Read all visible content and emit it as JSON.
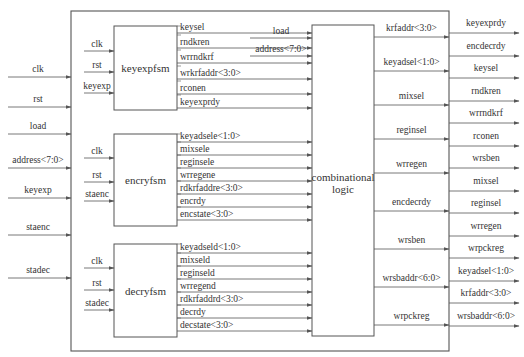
{
  "diagram": {
    "outer_box": {
      "x": 71,
      "y": 11,
      "w": 378,
      "h": 340
    },
    "colors": {
      "line": "#555555",
      "text": "#333333",
      "background": "#ffffff"
    },
    "external_inputs": [
      {
        "label": "clk",
        "y": 77
      },
      {
        "label": "rst",
        "y": 107
      },
      {
        "label": "load",
        "y": 134
      },
      {
        "label": "address<7:0>",
        "y": 168
      },
      {
        "label": "keyexp",
        "y": 198
      },
      {
        "label": "staenc",
        "y": 235
      },
      {
        "label": "stadec",
        "y": 278
      }
    ],
    "blocks": [
      {
        "name": "keyexpfsm",
        "x": 114,
        "y": 26,
        "w": 63,
        "h": 84,
        "inputs": [
          {
            "label": "clk",
            "y": 51
          },
          {
            "label": "rst",
            "y": 72
          },
          {
            "label": "keyexp",
            "y": 93
          }
        ],
        "outputs": [
          {
            "label": "keysel",
            "y": 33
          },
          {
            "label": "rndkren",
            "y": 48
          },
          {
            "label": "wrrndkrf",
            "y": 63
          },
          {
            "label": "wrkrfaddr<3:0>",
            "y": 79
          },
          {
            "label": "rconen",
            "y": 94
          },
          {
            "label": "keyexprdy",
            "y": 108
          }
        ]
      },
      {
        "name": "encryfsm",
        "x": 114,
        "y": 134,
        "w": 63,
        "h": 92,
        "inputs": [
          {
            "label": "clk",
            "y": 158
          },
          {
            "label": "rst",
            "y": 182
          },
          {
            "label": "staenc",
            "y": 201
          }
        ],
        "outputs": [
          {
            "label": "keyadsele<1:0>",
            "y": 142
          },
          {
            "label": "mixsele",
            "y": 155
          },
          {
            "label": "reginsele",
            "y": 168
          },
          {
            "label": "wrregene",
            "y": 181
          },
          {
            "label": "rdkrfaddre<3:0>",
            "y": 194
          },
          {
            "label": "encrdy",
            "y": 207
          },
          {
            "label": "encstate<3:0>",
            "y": 220
          }
        ]
      },
      {
        "name": "decryfsm",
        "x": 114,
        "y": 244,
        "w": 63,
        "h": 93,
        "inputs": [
          {
            "label": "clk",
            "y": 268
          },
          {
            "label": "rst",
            "y": 290
          },
          {
            "label": "stadec",
            "y": 310
          }
        ],
        "outputs": [
          {
            "label": "keyadseld<1:0>",
            "y": 253
          },
          {
            "label": "mixseld",
            "y": 266
          },
          {
            "label": "reginseld",
            "y": 279
          },
          {
            "label": "wrregend",
            "y": 292
          },
          {
            "label": "rdkrfaddrd<3:0>",
            "y": 305
          },
          {
            "label": "decrdy",
            "y": 318
          },
          {
            "label": "decstate<3:0>",
            "y": 331
          }
        ]
      }
    ],
    "comb_logic": {
      "label_line1": "combinational",
      "label_line2": "logic",
      "x": 312,
      "y": 25,
      "w": 62,
      "h": 311,
      "direct_inputs": [
        {
          "label": "load",
          "y": 38
        },
        {
          "label": "address<7:0>",
          "y": 56
        }
      ],
      "outputs": [
        {
          "label": "krfaddr<3:0>",
          "y": 37
        },
        {
          "label": "keyadsel<1:0>",
          "y": 71
        },
        {
          "label": "mixsel",
          "y": 105
        },
        {
          "label": "reginsel",
          "y": 139
        },
        {
          "label": "wrregen",
          "y": 173
        },
        {
          "label": "encdecrdy",
          "y": 211
        },
        {
          "label": "wrsben",
          "y": 249
        },
        {
          "label": "wrsbaddr<6:0>",
          "y": 287
        },
        {
          "label": "wrpckreg",
          "y": 325
        }
      ]
    },
    "external_outputs": [
      {
        "label": "keyexprdy",
        "y": 33
      },
      {
        "label": "encdecrdy",
        "y": 56
      },
      {
        "label": "keysel",
        "y": 78
      },
      {
        "label": "rndkren",
        "y": 101
      },
      {
        "label": "wrrndkrf",
        "y": 123
      },
      {
        "label": "rconen",
        "y": 146
      },
      {
        "label": "wrsben",
        "y": 168
      },
      {
        "label": "mixsel",
        "y": 191
      },
      {
        "label": "reginsel",
        "y": 213
      },
      {
        "label": "wrregen",
        "y": 236
      },
      {
        "label": "wrpckreg",
        "y": 258
      },
      {
        "label": "keyadsel<1:0>",
        "y": 281
      },
      {
        "label": "krfaddr<3:0>",
        "y": 303
      },
      {
        "label": "wrsbaddr<6:0>",
        "y": 326
      }
    ]
  }
}
